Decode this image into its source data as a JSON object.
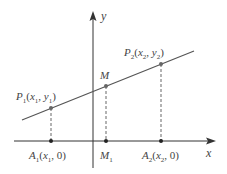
{
  "diagram": {
    "colors": {
      "axis": "#333333",
      "line": "#555555",
      "point": "#555555",
      "dash": "#555555",
      "label": "#444444"
    },
    "axes": {
      "x_label": "x",
      "y_label": "y"
    },
    "points": {
      "P1": {
        "name": "P",
        "sub": "1",
        "coords": [
          "x",
          "1",
          "y",
          "1"
        ]
      },
      "P2": {
        "name": "P",
        "sub": "2",
        "coords": [
          "x",
          "2",
          "y",
          "2"
        ]
      },
      "M": {
        "name": "M"
      },
      "A1": {
        "name": "A",
        "sub": "1",
        "coord_x": "x",
        "coord_x_sub": "1",
        "coord_y": "0"
      },
      "M1": {
        "name": "M",
        "sub": "1"
      },
      "A2": {
        "name": "A",
        "sub": "2",
        "coord_x": "x",
        "coord_x_sub": "2",
        "coord_y": "0"
      }
    },
    "text": {
      "open_paren": "(",
      "close_paren": ")",
      "comma": ", ",
      "zero": "0"
    }
  }
}
